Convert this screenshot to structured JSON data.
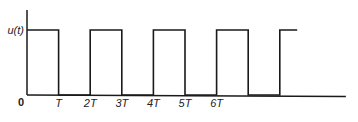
{
  "chart_data": {
    "type": "line",
    "title": "",
    "subtitle": "",
    "xlabel": "",
    "ylabel": "u(t)",
    "origin_label": "0",
    "x_ticks": [
      {
        "value": 1,
        "label": "T"
      },
      {
        "value": 2,
        "label": "2T"
      },
      {
        "value": 3,
        "label": "3T"
      },
      {
        "value": 4,
        "label": "4T"
      },
      {
        "value": 5,
        "label": "5T"
      },
      {
        "value": 6,
        "label": "6T"
      }
    ],
    "xlim": [
      0,
      9.3
    ],
    "ylim": [
      0,
      1.3
    ],
    "grid": false,
    "legend": "none",
    "series": [
      {
        "name": "u(t)",
        "points": [
          [
            0,
            1
          ],
          [
            1,
            1
          ],
          [
            1,
            0
          ],
          [
            2,
            0
          ],
          [
            2,
            1
          ],
          [
            3,
            1
          ],
          [
            3,
            0
          ],
          [
            4,
            0
          ],
          [
            4,
            1
          ],
          [
            5,
            1
          ],
          [
            5,
            0
          ],
          [
            6,
            0
          ],
          [
            6,
            1
          ],
          [
            7,
            1
          ],
          [
            7,
            0
          ],
          [
            8,
            0
          ],
          [
            8,
            1
          ],
          [
            8.55,
            1
          ]
        ]
      }
    ]
  }
}
